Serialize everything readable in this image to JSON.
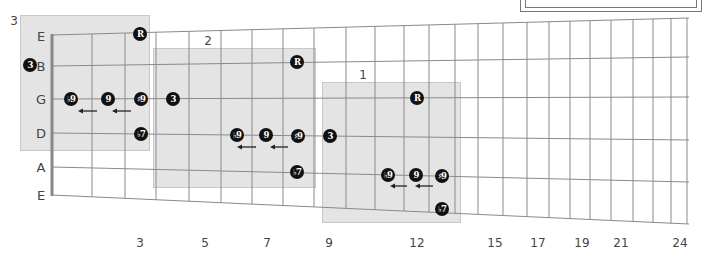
{
  "diagram": {
    "type": "guitar-fretboard",
    "string_labels": [
      "E",
      "B",
      "G",
      "D",
      "A",
      "E"
    ],
    "fret_markers": [
      "3",
      "5",
      "7",
      "9",
      "12",
      "15",
      "17",
      "19",
      "21",
      "24"
    ],
    "fret_marker_frets": [
      3,
      5,
      7,
      9,
      12,
      15,
      17,
      19,
      21,
      24
    ],
    "total_frets": 24,
    "positions": [
      {
        "label": "3",
        "x": 20,
        "y": 15,
        "w": 130,
        "h": 136,
        "label_x": 14,
        "label_y": 21
      },
      {
        "label": "2",
        "x": 153,
        "y": 48,
        "w": 163,
        "h": 140,
        "label_x": 208,
        "label_y": 41
      },
      {
        "label": "1",
        "x": 322,
        "y": 82,
        "w": 139,
        "h": 141,
        "label_x": 363,
        "label_y": 75
      }
    ],
    "notes": [
      {
        "position": "3",
        "string": "E",
        "symbol": "R",
        "x": 140,
        "y": 34
      },
      {
        "position": "3",
        "string": "B",
        "symbol": "3",
        "x": 30,
        "y": 65
      },
      {
        "position": "3",
        "string": "G",
        "symbol": "♭9",
        "x": 71,
        "y": 99
      },
      {
        "position": "3",
        "string": "G",
        "symbol": "9",
        "x": 108,
        "y": 99
      },
      {
        "position": "3",
        "string": "G",
        "symbol": "♯9",
        "x": 141,
        "y": 99
      },
      {
        "position": "3",
        "string": "G",
        "symbol": "3",
        "x": 173,
        "y": 99
      },
      {
        "position": "3",
        "string": "D",
        "symbol": "♭7",
        "x": 141,
        "y": 134
      },
      {
        "position": "2",
        "string": "B",
        "symbol": "R",
        "x": 297,
        "y": 62
      },
      {
        "position": "2",
        "string": "D",
        "symbol": "♭9",
        "x": 237,
        "y": 135
      },
      {
        "position": "2",
        "string": "D",
        "symbol": "9",
        "x": 266,
        "y": 135
      },
      {
        "position": "2",
        "string": "D",
        "symbol": "♯9",
        "x": 298,
        "y": 136
      },
      {
        "position": "2",
        "string": "D",
        "symbol": "3",
        "x": 330,
        "y": 136
      },
      {
        "position": "2",
        "string": "A",
        "symbol": "♭7",
        "x": 297,
        "y": 172
      },
      {
        "position": "1",
        "string": "G",
        "symbol": "R",
        "x": 417,
        "y": 98
      },
      {
        "position": "1",
        "string": "A",
        "symbol": "♭9",
        "x": 388,
        "y": 175
      },
      {
        "position": "1",
        "string": "A",
        "symbol": "9",
        "x": 416,
        "y": 175
      },
      {
        "position": "1",
        "string": "A",
        "symbol": "♯9",
        "x": 442,
        "y": 176
      },
      {
        "position": "1",
        "string": "E",
        "symbol": "♭7",
        "x": 442,
        "y": 209
      }
    ],
    "arrows": [
      {
        "direction": "left",
        "x1": 97,
        "x2": 78,
        "y": 111
      },
      {
        "direction": "left",
        "x1": 131,
        "x2": 112,
        "y": 111
      },
      {
        "direction": "left",
        "x1": 256,
        "x2": 237,
        "y": 147
      },
      {
        "direction": "left",
        "x1": 288,
        "x2": 270,
        "y": 147
      },
      {
        "direction": "left",
        "x1": 407,
        "x2": 390,
        "y": 186
      },
      {
        "direction": "left",
        "x1": 433,
        "x2": 415,
        "y": 186
      }
    ],
    "colors": {
      "dot_fill": "#111111",
      "dot_text": "#ffffff",
      "shade": "#d4d4d4",
      "line": "#8a8a8a",
      "nut": "#888888"
    }
  }
}
